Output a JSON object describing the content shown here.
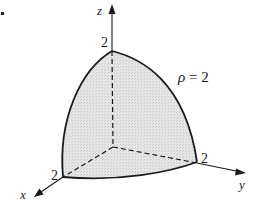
{
  "diagram": {
    "axes": {
      "x": {
        "label": "x",
        "tick_label": "2"
      },
      "y": {
        "label": "y",
        "tick_label": "2"
      },
      "z": {
        "label": "z",
        "tick_label": "2"
      }
    },
    "surface_label": {
      "symbol": "ρ",
      "equals": "= 2"
    },
    "colors": {
      "stroke": "#1a1a1a",
      "fill": "#e4e4e4"
    },
    "geometry": {
      "origin": [
        113,
        147
      ],
      "x_point": [
        63,
        177
      ],
      "y_point": [
        197,
        163
      ],
      "z_point": [
        112,
        50
      ]
    }
  }
}
